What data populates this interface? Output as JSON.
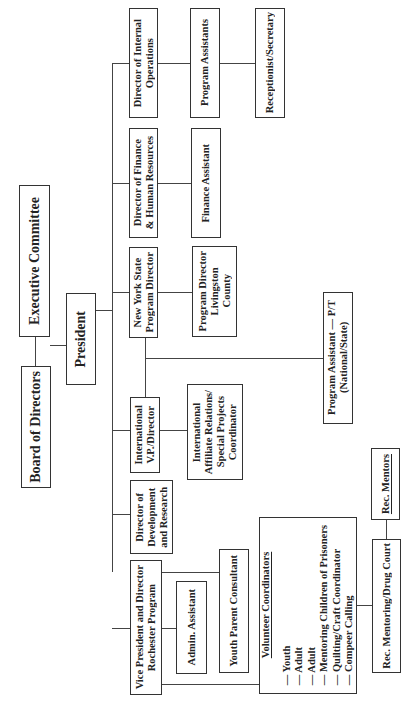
{
  "chart": {
    "orientation": "rotated-90-ccw",
    "nodes": {
      "board": "Board of Directors",
      "exec": "Executive Committee",
      "president": "President",
      "dir_internal_ops": "Director of Internal\nOperations",
      "program_assistants": "Program Assistants",
      "receptionist": "Receptionist/Secretary",
      "dir_finance_hr": "Director of Finance\n& Human Resources",
      "finance_assistant": "Finance Assistant",
      "nys_program_director": "New York State\nProgram Director",
      "program_director_livingston": "Program Director\nLivingston\nCounty",
      "program_assistant_pt": "Program Assistant — P/T\n(National/State)",
      "intl_vp_director": "International\nV.P./Director",
      "intl_affiliate_coord": "International\nAffiliate Relations/\nSpecial Projects\nCoordinator",
      "dir_dev_research": "Director of\nDevelopment\nand Research",
      "vp_rochester": "Vice President and Director\nRochester Program",
      "admin_assistant": "Admin. Assistant",
      "youth_parent_consultant": "Youth Parent Consultant",
      "volunteer_coordinators": {
        "title": "Volunteer Coordinators",
        "items": [
          "— Youth",
          "— Adult",
          "— Adult",
          "— Mentoring Children of Prisoners",
          "— Quilting/Craft Coordinator",
          "— Compeer Calling"
        ]
      },
      "rec_mentoring_drug_court": "Rec. Mentoring/Drug Court",
      "rec_mentors": "Rec. Mentors"
    },
    "edges": [
      [
        "board",
        "exec"
      ],
      [
        "board",
        "president"
      ],
      [
        "president",
        "dir_internal_ops"
      ],
      [
        "president",
        "dir_finance_hr"
      ],
      [
        "president",
        "nys_program_director"
      ],
      [
        "president",
        "intl_vp_director"
      ],
      [
        "president",
        "dir_dev_research"
      ],
      [
        "president",
        "vp_rochester"
      ],
      [
        "dir_internal_ops",
        "program_assistants"
      ],
      [
        "program_assistants",
        "receptionist"
      ],
      [
        "dir_finance_hr",
        "finance_assistant"
      ],
      [
        "nys_program_director",
        "program_director_livingston"
      ],
      [
        "nys_program_director",
        "program_assistant_pt"
      ],
      [
        "intl_vp_director",
        "program_assistant_pt"
      ],
      [
        "intl_vp_director",
        "intl_affiliate_coord"
      ],
      [
        "vp_rochester",
        "admin_assistant"
      ],
      [
        "vp_rochester",
        "youth_parent_consultant"
      ],
      [
        "vp_rochester",
        "volunteer_coordinators"
      ],
      [
        "volunteer_coordinators",
        "rec_mentoring_drug_court"
      ],
      [
        "rec_mentoring_drug_court",
        "rec_mentors"
      ]
    ]
  }
}
